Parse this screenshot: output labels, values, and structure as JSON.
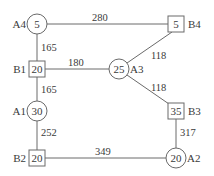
{
  "diagram": {
    "type": "network",
    "nodes": [
      {
        "id": "A4",
        "shape": "circle",
        "value": "5",
        "label": "A4",
        "x": 37,
        "y": 24,
        "label_side": "left"
      },
      {
        "id": "B4",
        "shape": "square",
        "value": "5",
        "label": "B4",
        "x": 176,
        "y": 24,
        "label_side": "right"
      },
      {
        "id": "B1",
        "shape": "square",
        "value": "20",
        "label": "B1",
        "x": 37,
        "y": 69,
        "label_side": "left"
      },
      {
        "id": "A3",
        "shape": "circle",
        "value": "25",
        "label": "A3",
        "x": 119,
        "y": 69,
        "label_side": "right"
      },
      {
        "id": "A1",
        "shape": "circle",
        "value": "30",
        "label": "A1",
        "x": 37,
        "y": 111,
        "label_side": "left"
      },
      {
        "id": "B3",
        "shape": "square",
        "value": "35",
        "label": "B3",
        "x": 176,
        "y": 111,
        "label_side": "right"
      },
      {
        "id": "B2",
        "shape": "square",
        "value": "20",
        "label": "B2",
        "x": 37,
        "y": 158,
        "label_side": "left"
      },
      {
        "id": "A2",
        "shape": "circle",
        "value": "20",
        "label": "A2",
        "x": 176,
        "y": 158,
        "label_side": "right"
      }
    ],
    "edges": [
      {
        "from": "A4",
        "to": "B4",
        "weight": "280"
      },
      {
        "from": "A4",
        "to": "B1",
        "weight": "165"
      },
      {
        "from": "B1",
        "to": "A3",
        "weight": "180"
      },
      {
        "from": "A3",
        "to": "B4",
        "weight": "118"
      },
      {
        "from": "A3",
        "to": "B3",
        "weight": "118"
      },
      {
        "from": "B1",
        "to": "A1",
        "weight": "165"
      },
      {
        "from": "A1",
        "to": "B2",
        "weight": "252"
      },
      {
        "from": "B2",
        "to": "A2",
        "weight": "349"
      },
      {
        "from": "B3",
        "to": "A2",
        "weight": "317"
      }
    ]
  }
}
